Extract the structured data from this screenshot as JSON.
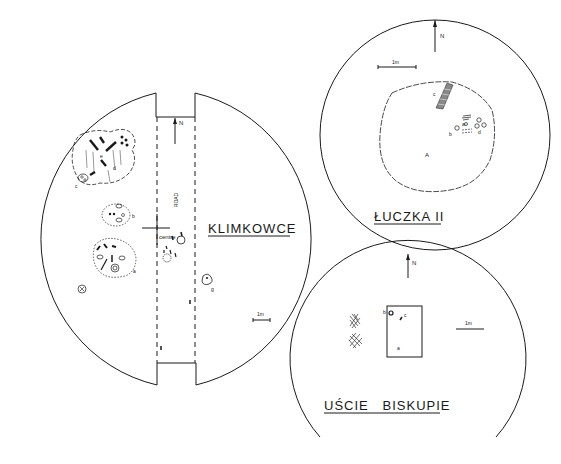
{
  "diagram": {
    "type": "archaeological site plans",
    "line_color": "#1a1a1a",
    "background": "#ffffff"
  },
  "sites": [
    {
      "name": "KLIMKOWCE",
      "north_label": "N",
      "scale_label": "1m",
      "road_label": "ROAD",
      "centre_label": "centre",
      "feature_labels": {
        "a": "a",
        "b": "b",
        "c": "c",
        "d": "d",
        "e": "e",
        "g": "g"
      }
    },
    {
      "name": "ŁUCZKA II",
      "north_label": "N",
      "scale_label": "1m",
      "feature_labels": {
        "A": "A",
        "a": "a",
        "b": "b",
        "c": "c",
        "d": "d"
      }
    },
    {
      "name": "UŚCIE   BISKUPIE",
      "north_label": "N",
      "scale_label": "1m",
      "feature_labels": {
        "a": "a",
        "b": "b",
        "c": "c"
      }
    }
  ]
}
